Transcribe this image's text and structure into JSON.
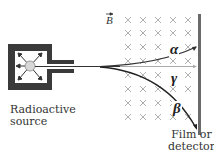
{
  "diagram": {
    "field_label": "B",
    "field_direction": "into page (×)",
    "source_label_line1": "Radioactive",
    "source_label_line2": "source",
    "detector_label_line1": "Film or",
    "detector_label_line2": "detector",
    "rays": [
      {
        "name": "alpha",
        "symbol": "α",
        "deflection": "up"
      },
      {
        "name": "gamma",
        "symbol": "γ",
        "deflection": "none"
      },
      {
        "name": "beta",
        "symbol": "β",
        "deflection": "down"
      }
    ],
    "colors": {
      "source_housing": "#3a3a3a",
      "field_marks": "#9a9a9a",
      "detector": "#6a6a6a",
      "trajectory": "#333333"
    }
  }
}
